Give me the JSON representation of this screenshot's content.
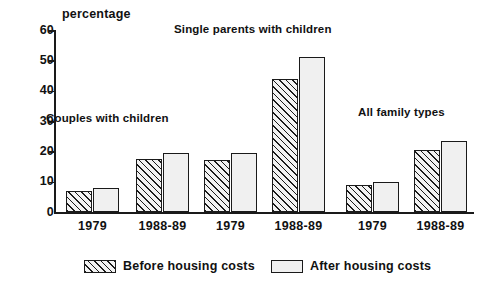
{
  "chart_data": {
    "type": "bar",
    "title": "",
    "subtitle": "",
    "xlabel": "",
    "ylabel": "percentage",
    "ylim": [
      0,
      60
    ],
    "yticks": [
      0,
      10,
      20,
      30,
      40,
      50,
      60
    ],
    "ytick_labels": [
      "0",
      "10",
      "20",
      "30",
      "40",
      "50",
      "60"
    ],
    "grid": false,
    "legend_position": "bottom",
    "categories": [
      "1979",
      "1988-89",
      "1979",
      "1988-89",
      "1979",
      "1988-89"
    ],
    "group_annotations": [
      "Couples with children",
      "Single parents with children",
      "All family types"
    ],
    "series": [
      {
        "name": "Before housing costs",
        "pattern": "diagonal-hatch",
        "values": [
          7,
          17.5,
          17,
          44,
          9,
          20.5
        ]
      },
      {
        "name": "After housing costs",
        "pattern": "dotted",
        "values": [
          8,
          19.5,
          19.5,
          51,
          10,
          23.5
        ]
      }
    ]
  },
  "axis": {
    "y_title": "percentage",
    "y_tick_labels": [
      "60",
      "50",
      "40",
      "30",
      "20",
      "10",
      "0"
    ],
    "x_tick_labels": [
      "1979",
      "1988-89",
      "1979",
      "1988-89",
      "1979",
      "1988-89"
    ]
  },
  "annotations": [
    {
      "text": "Couples with children",
      "left": 46,
      "top": 112
    },
    {
      "text": "Single parents with children",
      "left": 174,
      "top": 23
    },
    {
      "text": "All family types",
      "left": 358,
      "top": 106
    }
  ],
  "legend": {
    "items": [
      {
        "label": "Before housing costs",
        "pattern": "before",
        "left": 84
      },
      {
        "label": "After housing costs",
        "pattern": "after",
        "left": 271
      }
    ]
  },
  "colors": {
    "ink": "#1a1a1a",
    "background": "#ffffff",
    "hatch": "#1a1a1a",
    "dot": "#4a4a4a",
    "bar_fill": "#f0f0f0"
  }
}
